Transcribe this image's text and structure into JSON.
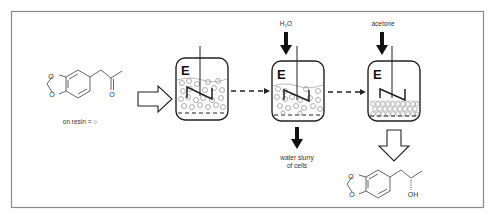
{
  "diagram": {
    "colors": {
      "frame": "#8a8a8a",
      "stroke": "#222222",
      "bead": "#9a9a9a",
      "text": "#333333"
    },
    "substrate": {
      "name": "3,4-methylenedioxyphenylacetone",
      "atoms": {
        "o1": "O",
        "o2": "O",
        "o3": "O"
      },
      "caption": "on resin = ○"
    },
    "reactors": [
      {
        "id": "reactor-1",
        "enzyme_label": "E",
        "state": "beads suspended in liquid"
      },
      {
        "id": "reactor-2",
        "enzyme_label": "E",
        "state": "beads suspended, washing",
        "input": "H₂O",
        "output_line1": "water slurry",
        "output_line2": "of cells"
      },
      {
        "id": "reactor-3",
        "enzyme_label": "E",
        "state": "beads packed at bottom",
        "input": "acetone"
      }
    ],
    "product": {
      "name": "(S)-1-(3,4-methylenedioxyphenyl)-2-propanol",
      "atoms": {
        "o1": "O",
        "o2": "O",
        "oh": "OH"
      }
    }
  }
}
